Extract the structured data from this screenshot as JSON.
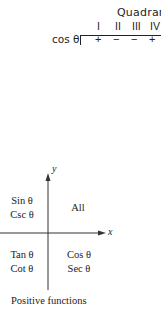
{
  "table": {
    "header": "Quadrant",
    "quadrants": [
      "I",
      "II",
      "III",
      "IV"
    ],
    "row": {
      "label": "cos θ",
      "signs": [
        "+",
        "−",
        "−",
        "+"
      ]
    }
  },
  "diagram": {
    "y_axis_label": "y",
    "x_axis_label": "x",
    "quadrant_II": [
      "Sin θ",
      "Csc θ"
    ],
    "quadrant_I": [
      "All"
    ],
    "quadrant_III": [
      "Tan θ",
      "Cot θ"
    ],
    "quadrant_IV": [
      "Cos θ",
      "Sec θ"
    ],
    "caption": "Positive functions"
  }
}
